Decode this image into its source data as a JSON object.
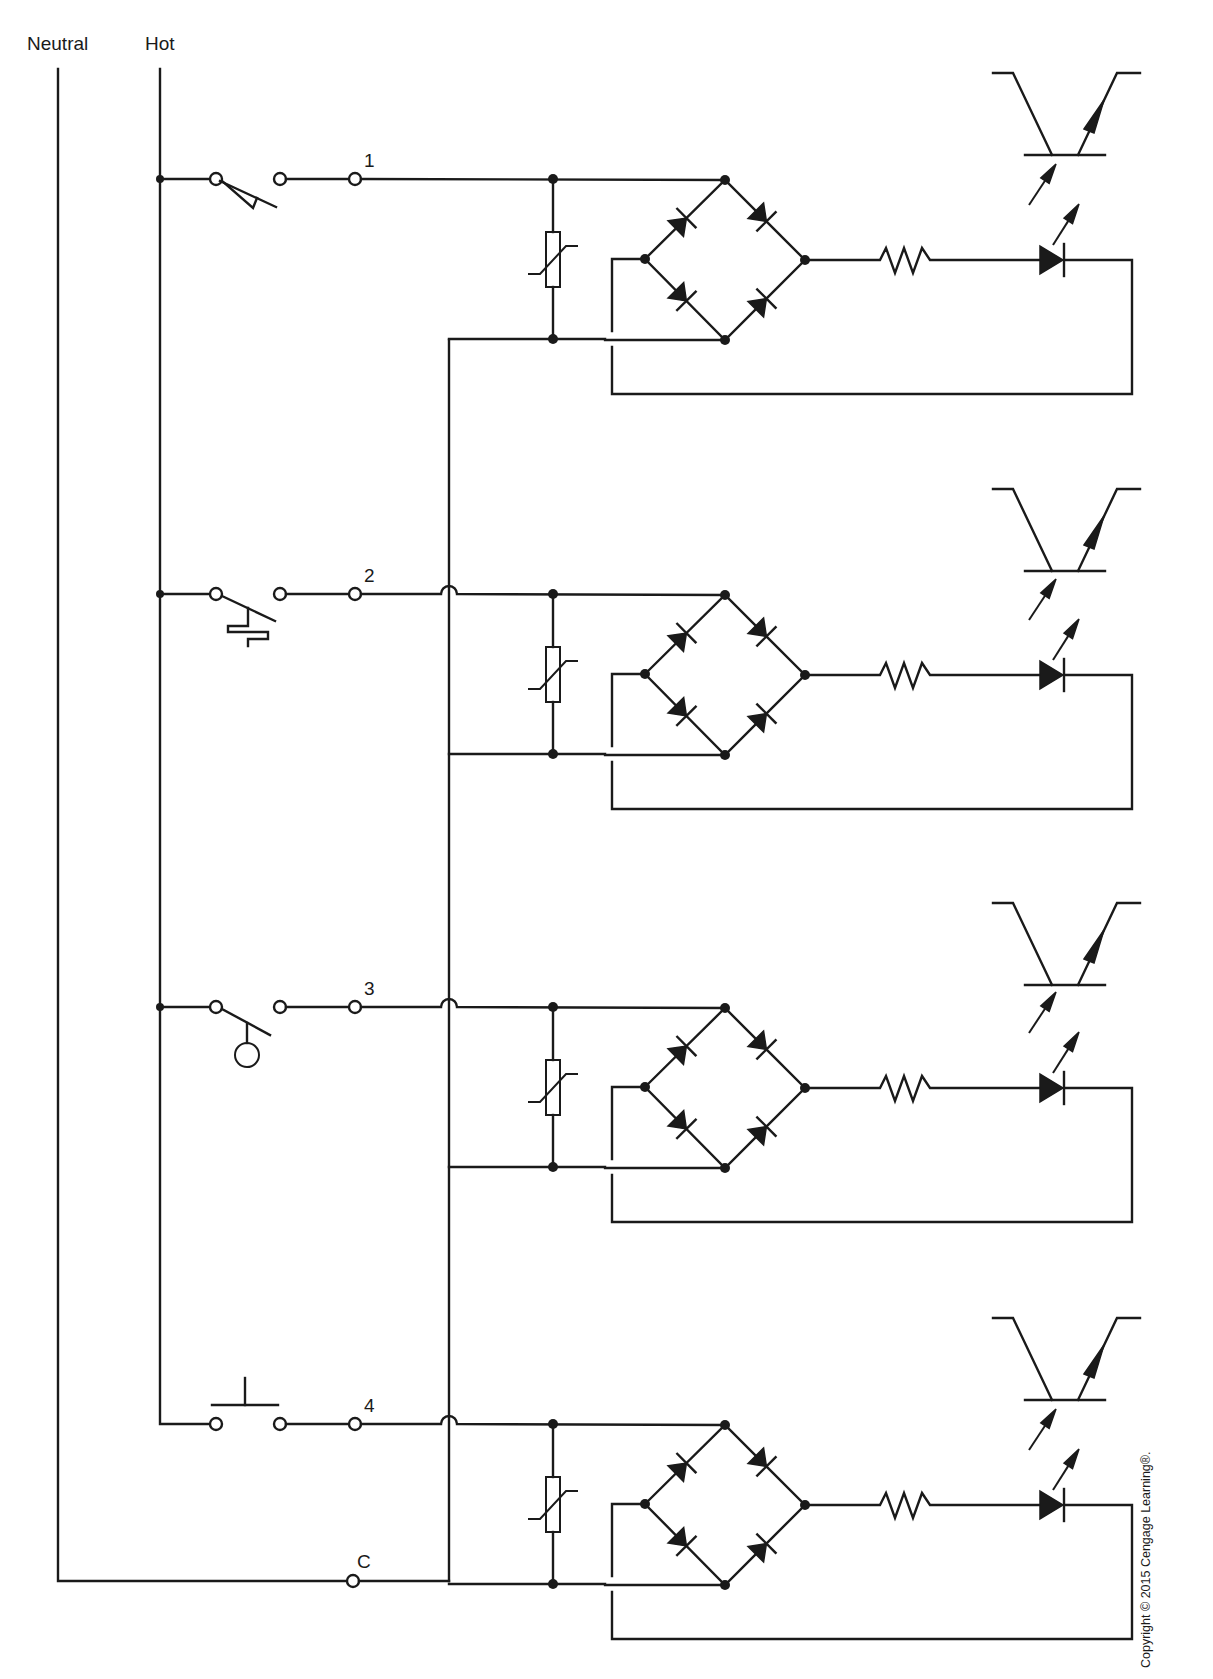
{
  "diagram": {
    "title_rails": {
      "neutral_label": "Neutral",
      "hot_label": "Hot"
    },
    "rows": [
      {
        "terminal_label": "1",
        "switch_type": "temperature-switch",
        "y": 179,
        "ov_y": 258
      },
      {
        "terminal_label": "2",
        "switch_type": "flow-switch",
        "y": 594,
        "ov_y": 674
      },
      {
        "terminal_label": "3",
        "switch_type": "float-switch",
        "y": 1007,
        "ov_y": 1088
      },
      {
        "terminal_label": "4",
        "switch_type": "pushbutton-switch",
        "y": 1424,
        "ov_y": 1503
      }
    ],
    "common_terminal_label": "C",
    "common_y": 1581,
    "copyright": "Copyright © 2015 Cengage Learning®.",
    "components_per_row": [
      "MOV (varistor)",
      "Bridge rectifier (4 diodes)",
      "Resistor",
      "LED",
      "Phototransistor"
    ],
    "colors": {
      "ink": "#1a1a1a",
      "background": "#ffffff"
    }
  }
}
